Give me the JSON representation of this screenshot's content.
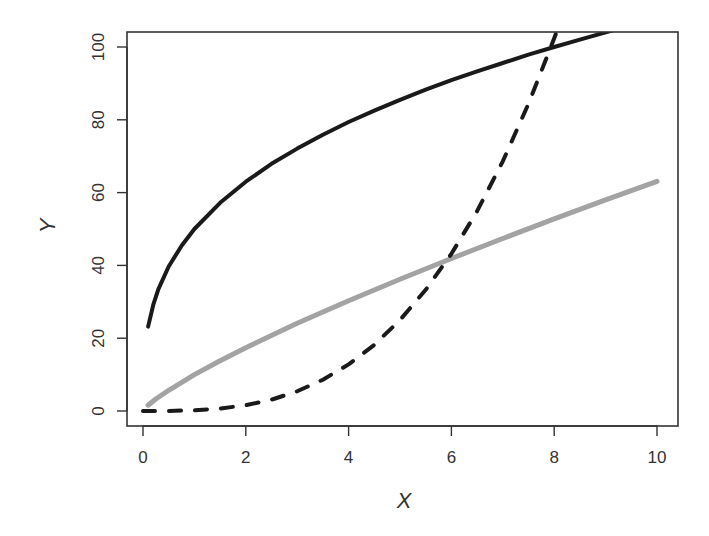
{
  "chart_data": {
    "type": "line",
    "title": "",
    "xlabel": "X",
    "ylabel": "Y",
    "xlim": [
      0,
      10
    ],
    "ylim": [
      0,
      104
    ],
    "grid": false,
    "legend": null,
    "x_ticks": [
      0,
      2,
      4,
      6,
      8,
      10
    ],
    "y_ticks": [
      0,
      20,
      40,
      60,
      80,
      100
    ],
    "series": [
      {
        "name": "black-solid",
        "style": "solid",
        "color": "#1a1a1a",
        "width": 4,
        "x": [
          0.1,
          0.2,
          0.3,
          0.5,
          0.75,
          1,
          1.5,
          2,
          2.5,
          3,
          3.5,
          4,
          4.5,
          5,
          5.5,
          6,
          6.5,
          7,
          7.5,
          8,
          8.5,
          9,
          9.2
        ],
        "y": [
          23.2,
          29.2,
          33.5,
          39.7,
          45.4,
          50.0,
          57.2,
          63.0,
          67.9,
          72.1,
          75.9,
          79.4,
          82.5,
          85.5,
          88.3,
          90.9,
          93.3,
          95.6,
          97.9,
          100.0,
          102.0,
          104.0,
          104.8
        ]
      },
      {
        "name": "gray-solid",
        "style": "solid",
        "color": "#a3a3a3",
        "width": 5,
        "x": [
          0.1,
          0.25,
          0.5,
          1,
          1.5,
          2,
          3,
          4,
          5,
          6,
          7,
          8,
          9,
          10
        ],
        "y": [
          1.6,
          3.3,
          5.7,
          10.0,
          13.8,
          17.4,
          24.1,
          30.3,
          36.2,
          41.9,
          47.4,
          52.8,
          58.0,
          63.1
        ]
      },
      {
        "name": "black-dashed",
        "style": "dashed",
        "color": "#1a1a1a",
        "width": 4,
        "x": [
          0,
          0.5,
          1,
          1.5,
          2,
          2.5,
          3,
          3.5,
          4,
          4.5,
          5,
          5.5,
          6,
          6.5,
          7,
          7.5,
          8,
          8.05
        ],
        "y": [
          0,
          0.03,
          0.2,
          0.68,
          1.6,
          3.1,
          5.4,
          8.6,
          12.8,
          18.2,
          25.0,
          33.3,
          43.2,
          54.9,
          68.6,
          84.4,
          102.4,
          104.3
        ]
      }
    ]
  },
  "axes": {
    "x_tick_labels": [
      "0",
      "2",
      "4",
      "6",
      "8",
      "10"
    ],
    "y_tick_labels": [
      "0",
      "20",
      "40",
      "60",
      "80",
      "100"
    ],
    "xlabel": "X",
    "ylabel": "Y"
  }
}
